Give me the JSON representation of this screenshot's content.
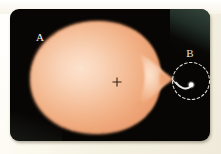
{
  "figure": {
    "kind": "astronomy-diagram",
    "plate_background_color": "#080604",
    "page_background_color": "#f3f0e4",
    "labels": [
      {
        "id": "A",
        "text": "A",
        "role": "primary-star-label",
        "color": "#f4f2ee",
        "x": 32,
        "y": 28
      },
      {
        "id": "B",
        "text": "B",
        "role": "secondary-compact-object-label",
        "color": "#f4f2ee",
        "x": 180,
        "y": 47
      }
    ],
    "star_a": {
      "name": "primary-star",
      "shape": "teardrop-roche-lobe",
      "fill_center_color": "#f8d3b8",
      "fill_mid_color": "#f3b890",
      "fill_edge_color": "#eda171",
      "edge_style": "dithered-soft",
      "center_marker": {
        "symbol": "+",
        "color": "#3a1f12",
        "x": 107,
        "y": 73
      }
    },
    "object_b": {
      "name": "compact-companion",
      "dot_color": "#ffffff",
      "roche_lobe_style": "dashed-circle",
      "roche_lobe_color": "#d8d6d0"
    },
    "accretion_stream": {
      "name": "accretion-stream",
      "color": "#eceae6",
      "description": "gas stream from L1 point curving onto the companion"
    }
  }
}
